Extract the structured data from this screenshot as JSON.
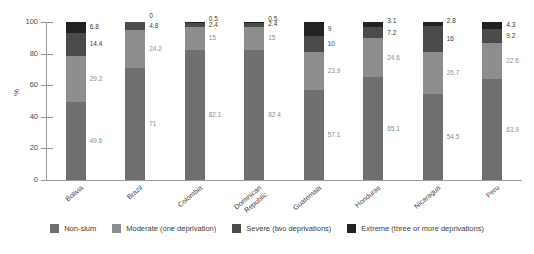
{
  "chart_data": {
    "type": "bar",
    "subtype": "stacked-bar-100-percent",
    "title": "",
    "xlabel": "",
    "ylabel": "%",
    "ylim": [
      0,
      100
    ],
    "yticks": [
      0,
      20,
      40,
      60,
      80,
      100
    ],
    "grid": false,
    "legend_position": "bottom",
    "categories": [
      "Bolivia",
      "Brazil",
      "Colombia",
      "Dominican Republic",
      "Guatemala",
      "Honduras",
      "Nicaragua",
      "Peru"
    ],
    "series": [
      {
        "name": "Non-slum",
        "color": "#6f6f6f",
        "values": [
          49.6,
          71,
          82.1,
          82.4,
          57.1,
          65.1,
          54.5,
          63.9
        ],
        "labels": [
          "49.6",
          "71",
          "82.1",
          "82.4",
          "57.1",
          "65.1",
          "54.5",
          "63.9"
        ]
      },
      {
        "name": "Moderate (one deprivation)",
        "color": "#8d8d8d",
        "values": [
          29.2,
          24.2,
          15,
          15,
          23.9,
          24.6,
          26.7,
          22.6
        ],
        "labels": [
          "29.2",
          "24.2",
          "15",
          "15",
          "23.9",
          "24.6",
          "26.7",
          "22.6"
        ]
      },
      {
        "name": "Severe (two deprivations)",
        "color": "#4b4b4b",
        "values": [
          14.4,
          4.8,
          2.4,
          2.4,
          10,
          7.2,
          16,
          9.2
        ],
        "labels": [
          "14.4",
          "4.8",
          "2.4",
          "2.4",
          "10",
          "7.2",
          "16",
          "9.2"
        ]
      },
      {
        "name": "Extreme (three or more deprivations)",
        "color": "#222222",
        "values": [
          6.8,
          0,
          0.5,
          0.5,
          9,
          3.1,
          2.8,
          4.3
        ],
        "labels": [
          "6.8",
          "0",
          "0.5",
          "0.5",
          "9",
          "3.1",
          "2.8",
          "4.3"
        ]
      }
    ]
  },
  "axis": {
    "y_title": "%",
    "y_tick_labels": [
      "0",
      "20",
      "40",
      "60",
      "80",
      "100"
    ]
  },
  "legend": {
    "items": [
      {
        "label": "Non-slum",
        "color": "#6f6f6f"
      },
      {
        "label": "Moderate (one deprivation)",
        "color": "#8d8d8d"
      },
      {
        "label": "Severe (two deprivations)",
        "color": "#4b4b4b"
      },
      {
        "label": "Extreme (three or more deprivations)",
        "color": "#222222"
      }
    ]
  }
}
